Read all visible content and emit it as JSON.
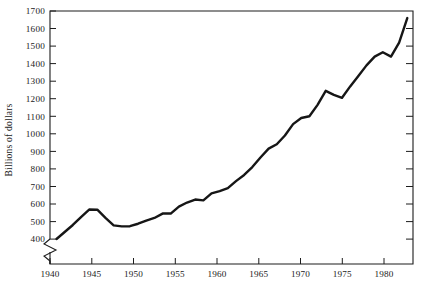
{
  "chart_data": {
    "type": "line",
    "title": "",
    "subtitle": "",
    "xlabel": "",
    "ylabel": "Billions of dollars",
    "xlim": [
      1939.2,
      1983.7
    ],
    "ylim": [
      400,
      1700
    ],
    "y_axis_break": true,
    "y_axis_break_note": "axis broken below 400",
    "grid": false,
    "legend": null,
    "ytick_labels": [
      "400",
      "500",
      "600",
      "700",
      "800",
      "900",
      "1000",
      "1100",
      "1200",
      "1300",
      "1400",
      "1500",
      "1600",
      "1700"
    ],
    "ytick_values": [
      400,
      500,
      600,
      700,
      800,
      900,
      1000,
      1100,
      1200,
      1300,
      1400,
      1500,
      1600,
      1700
    ],
    "xtick_labels": [
      "1940",
      "1945",
      "1950",
      "1955",
      "1960",
      "1965",
      "1970",
      "1975",
      "1980"
    ],
    "xtick_values": [
      1940,
      1945,
      1950,
      1955,
      1960,
      1965,
      1970,
      1975,
      1980
    ],
    "series": [
      {
        "name": "Billions of dollars",
        "color": "#161616",
        "x": [
          1940,
          1941,
          1942,
          1943,
          1944,
          1945,
          1946,
          1947,
          1948,
          1949,
          1950,
          1951,
          1952,
          1953,
          1954,
          1955,
          1956,
          1957,
          1958,
          1959,
          1960,
          1961,
          1962,
          1963,
          1964,
          1965,
          1966,
          1967,
          1968,
          1969,
          1970,
          1971,
          1972,
          1973,
          1974,
          1975,
          1976,
          1977,
          1978,
          1979,
          1980,
          1981,
          1982,
          1983
        ],
        "values": [
          400,
          440,
          480,
          525,
          568,
          567,
          520,
          478,
          472,
          473,
          487,
          505,
          520,
          545,
          545,
          585,
          608,
          625,
          620,
          660,
          673,
          690,
          730,
          765,
          810,
          865,
          915,
          940,
          990,
          1055,
          1090,
          1100,
          1165,
          1245,
          1222,
          1205,
          1270,
          1330,
          1390,
          1440,
          1465,
          1440,
          1520,
          1660
        ]
      }
    ]
  },
  "axis": {
    "y_title": "Billions of dollars"
  }
}
